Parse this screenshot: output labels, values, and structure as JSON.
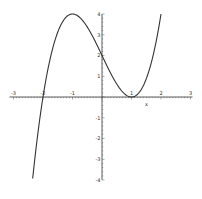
{
  "chart_data": {
    "type": "line",
    "title": "",
    "xlabel": "x",
    "ylabel": "",
    "xlim": [
      -3,
      3
    ],
    "ylim": [
      -4,
      4
    ],
    "grid": false,
    "legend": null,
    "x_ticks": [
      "-3",
      "-2",
      "-1",
      "1",
      "2",
      "3"
    ],
    "y_ticks": [
      "4",
      "3",
      "2",
      "1",
      "-1",
      "-2",
      "-3",
      "-4"
    ],
    "series": [
      {
        "name": "x^3 - 3x + 2",
        "x": [
          -2.35,
          -2.0,
          -1.5,
          -1.0,
          -0.5,
          0.0,
          0.5,
          1.0,
          1.5,
          2.0
        ],
        "y": [
          -4.0,
          0.0,
          3.125,
          4.0,
          3.375,
          2.0,
          0.625,
          0.0,
          0.875,
          4.0
        ]
      }
    ],
    "style": {
      "line_color": "#333333",
      "axis_color": "#333333"
    }
  }
}
